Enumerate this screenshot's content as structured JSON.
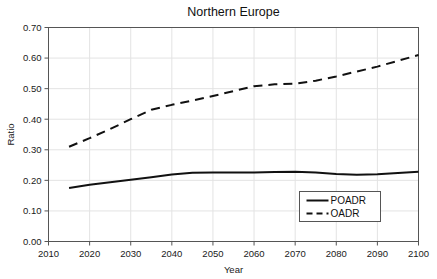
{
  "chart_data": {
    "type": "line",
    "title": "Northern Europe",
    "xlabel": "Year",
    "ylabel": "Ratio",
    "xlim": [
      2010,
      2100
    ],
    "ylim": [
      0.0,
      0.7
    ],
    "grid": true,
    "legend_position": "bottom-right",
    "xticks": [
      "2010",
      "2020",
      "2030",
      "2040",
      "2050",
      "2060",
      "2070",
      "2080",
      "2090",
      "2100"
    ],
    "yticks": [
      "0.00",
      "0.10",
      "0.20",
      "0.30",
      "0.40",
      "0.50",
      "0.60",
      "0.70"
    ],
    "x": [
      2015,
      2020,
      2025,
      2030,
      2035,
      2040,
      2045,
      2050,
      2055,
      2060,
      2065,
      2070,
      2075,
      2080,
      2085,
      2090,
      2095,
      2100
    ],
    "series": [
      {
        "name": "POADR",
        "style": "solid",
        "color": "#111111",
        "values": [
          0.175,
          0.186,
          0.194,
          0.202,
          0.21,
          0.219,
          0.225,
          0.226,
          0.226,
          0.226,
          0.227,
          0.228,
          0.226,
          0.221,
          0.218,
          0.22,
          0.224,
          0.228
        ]
      },
      {
        "name": "OADR",
        "style": "dashed",
        "color": "#111111",
        "values": [
          0.31,
          0.338,
          0.368,
          0.4,
          0.431,
          0.447,
          0.461,
          0.476,
          0.492,
          0.508,
          0.514,
          0.516,
          0.526,
          0.54,
          0.556,
          0.572,
          0.591,
          0.61
        ]
      }
    ]
  },
  "legend": {
    "entries": [
      {
        "label": "POADR",
        "style": "solid"
      },
      {
        "label": "OADR",
        "style": "dashed"
      }
    ]
  }
}
